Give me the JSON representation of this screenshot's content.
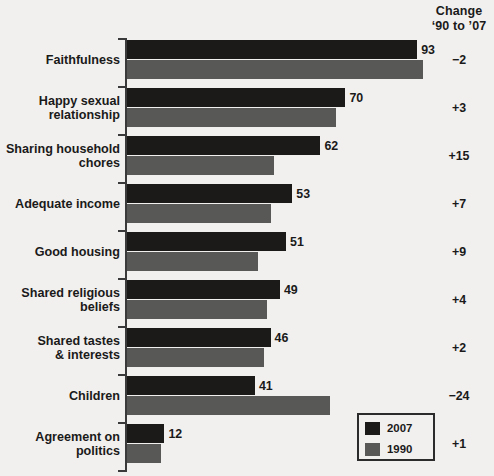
{
  "chart_data": {
    "type": "bar",
    "orientation": "horizontal",
    "title": "",
    "xlabel": "",
    "ylabel": "",
    "xlim": [
      0,
      100
    ],
    "grid": false,
    "legend_position": "bottom-right",
    "categories": [
      "Faithfulness",
      "Happy sexual relationship",
      "Sharing household chores",
      "Adequate income",
      "Good housing",
      "Shared religious beliefs",
      "Shared tastes & interests",
      "Children",
      "Agreement on politics"
    ],
    "series": [
      {
        "name": "2007",
        "color": "#1b1a19",
        "values": [
          93,
          70,
          62,
          53,
          51,
          49,
          46,
          41,
          12
        ]
      },
      {
        "name": "1990",
        "color": "#585857",
        "values": [
          95,
          67,
          47,
          46,
          42,
          45,
          44,
          65,
          11
        ]
      }
    ],
    "value_labels": [
      "93",
      "70",
      "62",
      "53",
      "51",
      "49",
      "46",
      "41",
      "12"
    ],
    "change_column_header": [
      "Change",
      "'90 to '07"
    ],
    "change_values": [
      "−2",
      "+3",
      "+15",
      "+7",
      "+9",
      "+4",
      "+2",
      "−24",
      "+1"
    ]
  },
  "header": {
    "change_line1": "Change",
    "change_line2": "‘90 to ’07"
  },
  "rows": [
    {
      "label_lines": [
        "Faithfulness"
      ],
      "v2007": 93,
      "v1990": 95,
      "value_label": "93",
      "change": "−2"
    },
    {
      "label_lines": [
        "Happy sexual",
        "relationship"
      ],
      "v2007": 70,
      "v1990": 67,
      "value_label": "70",
      "change": "+3"
    },
    {
      "label_lines": [
        "Sharing household",
        "chores"
      ],
      "v2007": 62,
      "v1990": 47,
      "value_label": "62",
      "change": "+15"
    },
    {
      "label_lines": [
        "Adequate income"
      ],
      "v2007": 53,
      "v1990": 46,
      "value_label": "53",
      "change": "+7"
    },
    {
      "label_lines": [
        "Good housing"
      ],
      "v2007": 51,
      "v1990": 42,
      "value_label": "51",
      "change": "+9"
    },
    {
      "label_lines": [
        "Shared religious",
        "beliefs"
      ],
      "v2007": 49,
      "v1990": 45,
      "value_label": "49",
      "change": "+4"
    },
    {
      "label_lines": [
        "Shared tastes",
        "& interests"
      ],
      "v2007": 46,
      "v1990": 44,
      "value_label": "46",
      "change": "+2"
    },
    {
      "label_lines": [
        "Children"
      ],
      "v2007": 41,
      "v1990": 65,
      "value_label": "41",
      "change": "−24"
    },
    {
      "label_lines": [
        "Agreement on",
        "politics"
      ],
      "v2007": 12,
      "v1990": 11,
      "value_label": "12",
      "change": "+1"
    }
  ],
  "legend": {
    "items": [
      {
        "label": "2007",
        "color": "#1b1a19"
      },
      {
        "label": "1990",
        "color": "#585857"
      }
    ]
  },
  "scale": {
    "px_per_unit": 3.12,
    "axis_x": 127,
    "row_height": 48,
    "plot_top": 36
  }
}
